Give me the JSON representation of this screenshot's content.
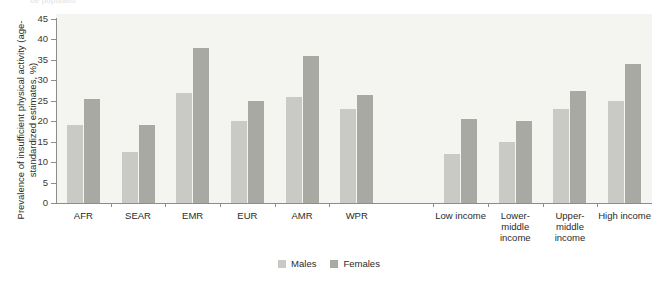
{
  "figure": {
    "top_fragment": "be populatio",
    "background_color": "#f4f4f1",
    "axis_color": "#8d8d8a"
  },
  "legend": {
    "position": "bottom-center",
    "items": [
      {
        "label": "Males",
        "color": "#c9c9c5"
      },
      {
        "label": "Females",
        "color": "#a9a9a4"
      }
    ]
  },
  "chart_data": {
    "type": "bar",
    "title": "",
    "subtitle": "",
    "xlabel": "",
    "ylabel": "Prevalence of insufficient physical activity (age-standardized estimates, %)",
    "ylim": [
      0,
      45
    ],
    "yticks": [
      0,
      5,
      10,
      15,
      20,
      25,
      30,
      35,
      40,
      45
    ],
    "ytick_labels": [
      "0",
      "5",
      "10",
      "15",
      "20",
      "25",
      "30",
      "35",
      "40",
      "45"
    ],
    "grid": false,
    "legend_position": "bottom-center",
    "categories": [
      "AFR",
      "SEAR",
      "EMR",
      "EUR",
      "AMR",
      "WPR",
      "Low income",
      "Lower-\nmiddle\nincome",
      "Upper-\nmiddle\nincome",
      "High income"
    ],
    "series": [
      {
        "name": "Males",
        "color": "#c9c9c5",
        "values": [
          19.0,
          12.5,
          27.0,
          20.0,
          26.0,
          23.0,
          12.0,
          15.0,
          23.0,
          25.0
        ]
      },
      {
        "name": "Females",
        "color": "#a9a9a4",
        "values": [
          25.5,
          19.0,
          38.0,
          25.0,
          36.0,
          26.5,
          20.5,
          20.0,
          27.5,
          34.0
        ]
      }
    ],
    "group_gap_after_index": 5
  }
}
